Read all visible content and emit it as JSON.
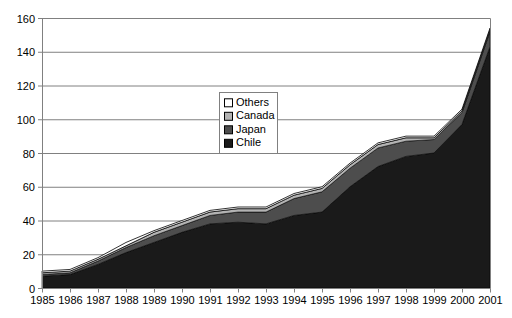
{
  "chart_data": {
    "type": "area",
    "stacked": true,
    "title": "",
    "subtitle": "",
    "xlabel": "",
    "ylabel": "",
    "categories": [
      "1985",
      "1986",
      "1987",
      "1988",
      "1989",
      "1990",
      "1991",
      "1992",
      "1993",
      "1994",
      "1995",
      "1996",
      "1997",
      "1998",
      "1999",
      "2000",
      "2001"
    ],
    "x": [
      1985,
      1986,
      1987,
      1988,
      1989,
      1990,
      1991,
      1992,
      1993,
      1994,
      1995,
      1996,
      1997,
      1998,
      1999,
      2000,
      2001
    ],
    "series": [
      {
        "name": "Chile",
        "color": "#1a1a1a",
        "values": [
          7,
          8,
          14,
          21,
          27,
          33,
          38,
          39,
          38,
          43,
          45,
          60,
          72,
          78,
          80,
          97,
          143
        ]
      },
      {
        "name": "Japan",
        "color": "#4d4d4d",
        "values": [
          1,
          1,
          2,
          3,
          4,
          4,
          5,
          6,
          7,
          10,
          12,
          11,
          11,
          9,
          8,
          7,
          9
        ]
      },
      {
        "name": "Canada",
        "color": "#b3b3b3",
        "values": [
          1,
          1,
          1,
          1,
          2,
          2,
          2,
          2,
          2,
          2,
          2,
          2,
          2,
          2,
          1,
          1,
          1
        ]
      },
      {
        "name": "Others",
        "color": "#ffffff",
        "values": [
          1,
          1,
          1,
          2,
          1,
          1,
          1,
          1,
          1,
          1,
          1,
          1,
          1,
          1,
          1,
          1,
          1
        ]
      }
    ],
    "totals": [
      10,
      11,
      18,
      27,
      34,
      40,
      46,
      48,
      48,
      56,
      60,
      74,
      86,
      90,
      90,
      106,
      154
    ],
    "ylim": [
      0,
      160
    ],
    "ytick_step": 20,
    "yticks": [
      "0",
      "20",
      "40",
      "60",
      "80",
      "100",
      "120",
      "140",
      "160"
    ],
    "grid": "horizontal",
    "legend_position": "inside-upper-center",
    "legend_entries": [
      {
        "label": "Others",
        "swatch": "#ffffff"
      },
      {
        "label": "Canada",
        "swatch": "#b3b3b3"
      },
      {
        "label": "Japan",
        "swatch": "#4d4d4d"
      },
      {
        "label": "Chile",
        "swatch": "#1a1a1a"
      }
    ]
  },
  "axes": {
    "plot_left": 42,
    "plot_right": 490,
    "plot_top": 18,
    "plot_bottom": 288
  },
  "style": {
    "axis_color": "#808080",
    "grid_color": "#808080",
    "plot_border_color": "#808080",
    "background": "#ffffff",
    "text_color": "#000000"
  }
}
